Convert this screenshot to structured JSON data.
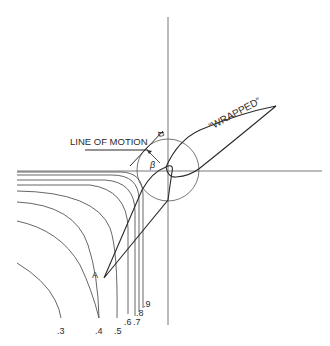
{
  "diagram": {
    "labels": {
      "line_of_motion": "LINE OF MOTION",
      "wrapped": "“WRAPPED”",
      "alpha": "α",
      "alpha_vector": "→",
      "beta": "β",
      "point_a": "A"
    },
    "contour_labels": [
      ".3",
      ".4",
      ".5",
      ".6",
      ".7",
      ".8",
      ".9"
    ],
    "colors": {
      "ink": "#2a2a2a",
      "thin": "#555555",
      "background": "#ffffff"
    }
  }
}
